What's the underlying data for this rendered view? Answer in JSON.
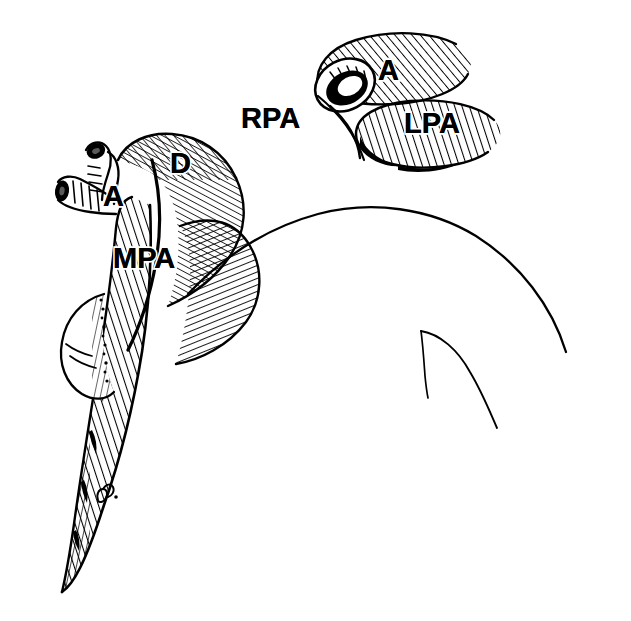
{
  "figure": {
    "type": "anatomical-line-illustration",
    "medium": "pen-and-ink stipple and hatch drawing",
    "background_color": "#ffffff",
    "ink_color": "#000000"
  },
  "labels": {
    "mpa": "MPA",
    "d": "D",
    "a_main": "A",
    "rpa": "RPA",
    "a_inset": "A",
    "lpa": "LPA"
  },
  "label_positions": {
    "mpa": {
      "x": 113,
      "y": 268,
      "size": 29
    },
    "d": {
      "x": 170,
      "y": 173,
      "size": 29
    },
    "a_main": {
      "x": 103,
      "y": 206,
      "size": 29
    },
    "rpa": {
      "x": 241,
      "y": 128,
      "size": 29
    },
    "a_inset": {
      "x": 378,
      "y": 80,
      "size": 29
    },
    "lpa": {
      "x": 404,
      "y": 133,
      "size": 29
    }
  },
  "structures": {
    "main_trunk": "Main pulmonary artery trunk, hatched, descending at left",
    "ductus": "Ductus segment labelled D",
    "branch_stubs": "Two cut vessel stubs with dark lumens at upper left",
    "appendage": "Rounded bulge along left border mid-figure",
    "silhouette": "Smooth unshaded arc of adjacent organ at right",
    "inset": "Upper-right inset of bifurcating vessel with open cut lumen"
  },
  "signature": {
    "present": true,
    "description": "small cursive artist initials on lower trunk",
    "x": 104,
    "y": 497
  }
}
